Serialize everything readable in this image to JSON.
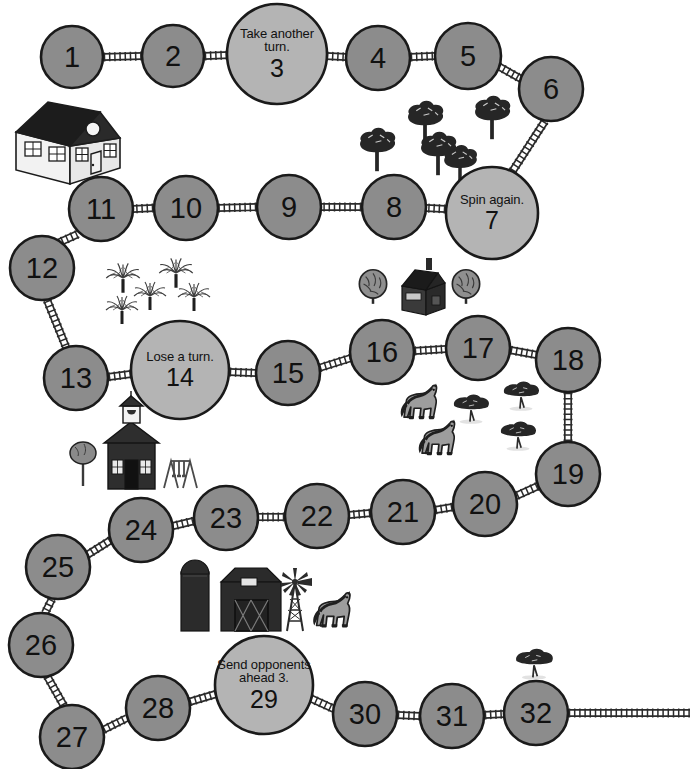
{
  "board": {
    "title": "Farm Trail Board Game",
    "colors": {
      "space_fill": "#8c8c8c",
      "special_fill": "#b4b4b4",
      "outline": "#1a1a1a",
      "fence": "#2b2b2b",
      "background": "#ffffff",
      "dark_structure": "#2e2e2e",
      "mid_gray": "#9a9a9a",
      "light_gray": "#c8c8c8"
    },
    "spaces": [
      {
        "id": 1,
        "number": "1",
        "text": "",
        "type": "plain",
        "cx": 72,
        "cy": 57,
        "r": 31
      },
      {
        "id": 2,
        "number": "2",
        "text": "",
        "type": "plain",
        "cx": 173,
        "cy": 56,
        "r": 31
      },
      {
        "id": 3,
        "number": "3",
        "text": "Take another turn.",
        "type": "special",
        "cx": 277,
        "cy": 54,
        "r": 50
      },
      {
        "id": 4,
        "number": "4",
        "text": "",
        "type": "plain",
        "cx": 378,
        "cy": 58,
        "r": 32
      },
      {
        "id": 5,
        "number": "5",
        "text": "",
        "type": "plain",
        "cx": 468,
        "cy": 56,
        "r": 33
      },
      {
        "id": 6,
        "number": "6",
        "text": "",
        "type": "plain",
        "cx": 551,
        "cy": 89,
        "r": 32
      },
      {
        "id": 7,
        "number": "7",
        "text": "Spin again.",
        "type": "special",
        "cx": 492,
        "cy": 213,
        "r": 46
      },
      {
        "id": 8,
        "number": "8",
        "text": "",
        "type": "plain",
        "cx": 394,
        "cy": 207,
        "r": 32
      },
      {
        "id": 9,
        "number": "9",
        "text": "",
        "type": "plain",
        "cx": 289,
        "cy": 207,
        "r": 32
      },
      {
        "id": 10,
        "number": "10",
        "text": "",
        "type": "plain",
        "cx": 186,
        "cy": 208,
        "r": 32
      },
      {
        "id": 11,
        "number": "11",
        "text": "",
        "type": "plain",
        "cx": 101,
        "cy": 209,
        "r": 32
      },
      {
        "id": 12,
        "number": "12",
        "text": "",
        "type": "plain",
        "cx": 42,
        "cy": 268,
        "r": 32
      },
      {
        "id": 13,
        "number": "13",
        "text": "",
        "type": "plain",
        "cx": 76,
        "cy": 378,
        "r": 32
      },
      {
        "id": 14,
        "number": "14",
        "text": "Lose a turn.",
        "type": "special",
        "cx": 180,
        "cy": 370,
        "r": 49
      },
      {
        "id": 15,
        "number": "15",
        "text": "",
        "type": "plain",
        "cx": 288,
        "cy": 373,
        "r": 32
      },
      {
        "id": 16,
        "number": "16",
        "text": "",
        "type": "plain",
        "cx": 382,
        "cy": 352,
        "r": 32
      },
      {
        "id": 17,
        "number": "17",
        "text": "",
        "type": "plain",
        "cx": 478,
        "cy": 348,
        "r": 32
      },
      {
        "id": 18,
        "number": "18",
        "text": "",
        "type": "plain",
        "cx": 568,
        "cy": 360,
        "r": 32
      },
      {
        "id": 19,
        "number": "19",
        "text": "",
        "type": "plain",
        "cx": 568,
        "cy": 474,
        "r": 32
      },
      {
        "id": 20,
        "number": "20",
        "text": "",
        "type": "plain",
        "cx": 485,
        "cy": 504,
        "r": 32
      },
      {
        "id": 21,
        "number": "21",
        "text": "",
        "type": "plain",
        "cx": 403,
        "cy": 512,
        "r": 32
      },
      {
        "id": 22,
        "number": "22",
        "text": "",
        "type": "plain",
        "cx": 317,
        "cy": 516,
        "r": 32
      },
      {
        "id": 23,
        "number": "23",
        "text": "",
        "type": "plain",
        "cx": 226,
        "cy": 518,
        "r": 32
      },
      {
        "id": 24,
        "number": "24",
        "text": "",
        "type": "plain",
        "cx": 141,
        "cy": 530,
        "r": 32
      },
      {
        "id": 25,
        "number": "25",
        "text": "",
        "type": "plain",
        "cx": 58,
        "cy": 567,
        "r": 32
      },
      {
        "id": 26,
        "number": "26",
        "text": "",
        "type": "plain",
        "cx": 41,
        "cy": 645,
        "r": 32
      },
      {
        "id": 27,
        "number": "27",
        "text": "",
        "type": "plain",
        "cx": 72,
        "cy": 737,
        "r": 32
      },
      {
        "id": 28,
        "number": "28",
        "text": "",
        "type": "plain",
        "cx": 158,
        "cy": 708,
        "r": 32
      },
      {
        "id": 29,
        "number": "29",
        "text": "Send opponents ahead 3.",
        "type": "special",
        "cx": 264,
        "cy": 685,
        "r": 49
      },
      {
        "id": 30,
        "number": "30",
        "text": "",
        "type": "plain",
        "cx": 365,
        "cy": 714,
        "r": 32
      },
      {
        "id": 31,
        "number": "31",
        "text": "",
        "type": "plain",
        "cx": 452,
        "cy": 716,
        "r": 32
      },
      {
        "id": 32,
        "number": "32",
        "text": "",
        "type": "plain",
        "cx": 536,
        "cy": 713,
        "r": 32
      }
    ],
    "fences": [
      {
        "from": "1",
        "to": "2",
        "x1": 103,
        "y1": 57,
        "x2": 142,
        "y2": 56
      },
      {
        "from": "2",
        "to": "3",
        "x1": 204,
        "y1": 56,
        "x2": 230,
        "y2": 55
      },
      {
        "from": "3",
        "to": "4",
        "x1": 326,
        "y1": 56,
        "x2": 346,
        "y2": 57
      },
      {
        "from": "4",
        "to": "5",
        "x1": 410,
        "y1": 57,
        "x2": 435,
        "y2": 56
      },
      {
        "from": "5",
        "to": "6",
        "x1": 498,
        "y1": 66,
        "x2": 523,
        "y2": 80
      },
      {
        "from": "6",
        "to": "7",
        "x1": 545,
        "y1": 121,
        "x2": 512,
        "y2": 172
      },
      {
        "from": "7",
        "to": "8",
        "x1": 446,
        "y1": 209,
        "x2": 426,
        "y2": 208
      },
      {
        "from": "8",
        "to": "9",
        "x1": 362,
        "y1": 207,
        "x2": 321,
        "y2": 207
      },
      {
        "from": "9",
        "to": "10",
        "x1": 257,
        "y1": 207,
        "x2": 218,
        "y2": 208
      },
      {
        "from": "10",
        "to": "11",
        "x1": 154,
        "y1": 208,
        "x2": 133,
        "y2": 209
      },
      {
        "from": "11",
        "to": "12",
        "x1": 78,
        "y1": 234,
        "x2": 58,
        "y2": 243
      },
      {
        "from": "12",
        "to": "13",
        "x1": 47,
        "y1": 300,
        "x2": 66,
        "y2": 347
      },
      {
        "from": "13",
        "to": "14",
        "x1": 108,
        "y1": 377,
        "x2": 131,
        "y2": 374
      },
      {
        "from": "14",
        "to": "15",
        "x1": 229,
        "y1": 372,
        "x2": 256,
        "y2": 373
      },
      {
        "from": "15",
        "to": "16",
        "x1": 319,
        "y1": 368,
        "x2": 351,
        "y2": 358
      },
      {
        "from": "16",
        "to": "17",
        "x1": 414,
        "y1": 351,
        "x2": 446,
        "y2": 349
      },
      {
        "from": "17",
        "to": "18",
        "x1": 510,
        "y1": 350,
        "x2": 537,
        "y2": 355
      },
      {
        "from": "18",
        "to": "19",
        "x1": 568,
        "y1": 392,
        "x2": 568,
        "y2": 442
      },
      {
        "from": "19",
        "to": "20",
        "x1": 538,
        "y1": 486,
        "x2": 516,
        "y2": 496
      },
      {
        "from": "20",
        "to": "21",
        "x1": 453,
        "y1": 507,
        "x2": 435,
        "y2": 510
      },
      {
        "from": "21",
        "to": "22",
        "x1": 371,
        "y1": 513,
        "x2": 349,
        "y2": 515
      },
      {
        "from": "22",
        "to": "23",
        "x1": 285,
        "y1": 517,
        "x2": 258,
        "y2": 517
      },
      {
        "from": "23",
        "to": "24",
        "x1": 194,
        "y1": 521,
        "x2": 173,
        "y2": 526
      },
      {
        "from": "24",
        "to": "25",
        "x1": 111,
        "y1": 540,
        "x2": 87,
        "y2": 555
      },
      {
        "from": "25",
        "to": "26",
        "x1": 52,
        "y1": 599,
        "x2": 45,
        "y2": 613
      },
      {
        "from": "26",
        "to": "27",
        "x1": 47,
        "y1": 676,
        "x2": 64,
        "y2": 706
      },
      {
        "from": "27",
        "to": "28",
        "x1": 103,
        "y1": 730,
        "x2": 127,
        "y2": 718
      },
      {
        "from": "28",
        "to": "29",
        "x1": 189,
        "y1": 702,
        "x2": 216,
        "y2": 694
      },
      {
        "from": "29",
        "to": "30",
        "x1": 310,
        "y1": 698,
        "x2": 334,
        "y2": 709
      },
      {
        "from": "30",
        "to": "31",
        "x1": 397,
        "y1": 715,
        "x2": 420,
        "y2": 716
      },
      {
        "from": "31",
        "to": "32",
        "x1": 484,
        "y1": 715,
        "x2": 504,
        "y2": 714
      },
      {
        "from": "32",
        "to": "end",
        "x1": 568,
        "y1": 713,
        "x2": 690,
        "y2": 713
      }
    ],
    "scenery": [
      {
        "name": "farmhouse",
        "label": "white house with dark roof",
        "x": 8,
        "y": 98
      },
      {
        "name": "pine-tree-grove",
        "label": "grove of five pine trees",
        "x": 358,
        "y": 92
      },
      {
        "name": "palm-tree-grove",
        "label": "cluster of five palm trees",
        "x": 98,
        "y": 258
      },
      {
        "name": "cottage-scene",
        "label": "dark cottage flanked by two trees",
        "x": 355,
        "y": 258
      },
      {
        "name": "schoolhouse",
        "label": "schoolhouse with tree and swing set",
        "x": 68,
        "y": 418
      },
      {
        "name": "horse-pasture",
        "label": "two horses with three acacia trees",
        "x": 395,
        "y": 382
      },
      {
        "name": "barn-scene",
        "label": "silo, barn, windmill and horse",
        "x": 175,
        "y": 556
      },
      {
        "name": "lone-acacia-tree",
        "label": "single acacia tree",
        "x": 502,
        "y": 640
      }
    ]
  }
}
